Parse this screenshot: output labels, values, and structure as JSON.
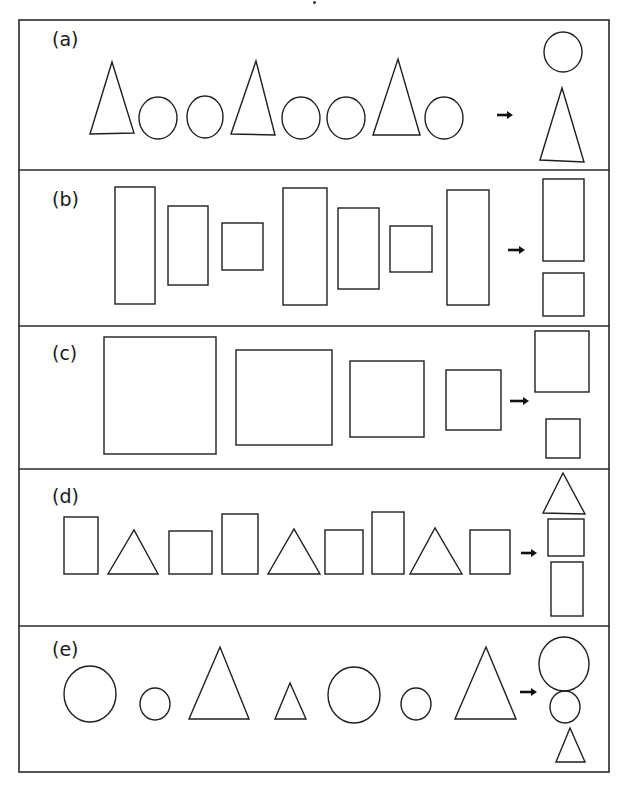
{
  "frame": {
    "x": 19,
    "y": 20,
    "width": 590,
    "height": 752,
    "stroke": "#2a2a2a",
    "stroke_width": 1.6
  },
  "panels": [
    {
      "id": "a",
      "label": "(a)",
      "top": 20,
      "bottom": 170,
      "label_x": 52,
      "label_y": 28,
      "arrow": {
        "x1": 497,
        "x2": 513,
        "y": 115
      },
      "sequence": [
        {
          "type": "triangle",
          "points": "90,134 112,62 134,133"
        },
        {
          "type": "circle",
          "cx": 158,
          "cy": 118,
          "rx": 19,
          "ry": 21
        },
        {
          "type": "circle",
          "cx": 205,
          "cy": 117,
          "rx": 18,
          "ry": 21
        },
        {
          "type": "triangle",
          "points": "231,134 256,61 275,135"
        },
        {
          "type": "circle",
          "cx": 301,
          "cy": 118,
          "rx": 19,
          "ry": 21
        },
        {
          "type": "circle",
          "cx": 346,
          "cy": 118,
          "rx": 19,
          "ry": 21
        },
        {
          "type": "triangle",
          "points": "373,135 398,59 420,135"
        },
        {
          "type": "circle",
          "cx": 444,
          "cy": 118,
          "rx": 19,
          "ry": 21
        }
      ],
      "answer": [
        {
          "type": "circle",
          "cx": 563,
          "cy": 52,
          "rx": 19,
          "ry": 20
        },
        {
          "type": "triangle",
          "points": "540,160 562,88 584,162"
        }
      ]
    },
    {
      "id": "b",
      "label": "(b)",
      "top": 170,
      "bottom": 326,
      "label_x": 52,
      "label_y": 188,
      "arrow": {
        "x1": 508,
        "x2": 525,
        "y": 250
      },
      "sequence": [
        {
          "type": "rect",
          "x": 115,
          "y": 187,
          "w": 40,
          "h": 117
        },
        {
          "type": "rect",
          "x": 168,
          "y": 206,
          "w": 40,
          "h": 79
        },
        {
          "type": "rect",
          "x": 222,
          "y": 223,
          "w": 41,
          "h": 47
        },
        {
          "type": "rect",
          "x": 283,
          "y": 188,
          "w": 44,
          "h": 117
        },
        {
          "type": "rect",
          "x": 338,
          "y": 208,
          "w": 41,
          "h": 81
        },
        {
          "type": "rect",
          "x": 390,
          "y": 226,
          "w": 42,
          "h": 46
        },
        {
          "type": "rect",
          "x": 447,
          "y": 190,
          "w": 42,
          "h": 115
        }
      ],
      "answer": [
        {
          "type": "rect",
          "x": 543,
          "y": 179,
          "w": 41,
          "h": 82
        },
        {
          "type": "rect",
          "x": 543,
          "y": 273,
          "w": 41,
          "h": 43
        }
      ]
    },
    {
      "id": "c",
      "label": "(c)",
      "top": 326,
      "bottom": 469,
      "label_x": 52,
      "label_y": 342,
      "arrow": {
        "x1": 510,
        "x2": 529,
        "y": 401
      },
      "sequence": [
        {
          "type": "rect",
          "x": 104,
          "y": 337,
          "w": 112,
          "h": 117
        },
        {
          "type": "rect",
          "x": 236,
          "y": 350,
          "w": 96,
          "h": 95
        },
        {
          "type": "rect",
          "x": 350,
          "y": 361,
          "w": 74,
          "h": 76
        },
        {
          "type": "rect",
          "x": 446,
          "y": 370,
          "w": 55,
          "h": 60
        }
      ],
      "answer": [
        {
          "type": "rect",
          "x": 535,
          "y": 331,
          "w": 54,
          "h": 61
        },
        {
          "type": "rect",
          "x": 546,
          "y": 419,
          "w": 34,
          "h": 39
        }
      ]
    },
    {
      "id": "d",
      "label": "(d)",
      "top": 469,
      "bottom": 626,
      "label_x": 52,
      "label_y": 485,
      "arrow": {
        "x1": 521,
        "x2": 537,
        "y": 553
      },
      "sequence": [
        {
          "type": "rect",
          "x": 64,
          "y": 517,
          "w": 34,
          "h": 57
        },
        {
          "type": "triangle",
          "points": "108,574 134,530 158,574"
        },
        {
          "type": "rect",
          "x": 169,
          "y": 531,
          "w": 43,
          "h": 43
        },
        {
          "type": "rect",
          "x": 222,
          "y": 514,
          "w": 36,
          "h": 60
        },
        {
          "type": "triangle",
          "points": "268,574 294,529 320,574"
        },
        {
          "type": "rect",
          "x": 325,
          "y": 530,
          "w": 38,
          "h": 44
        },
        {
          "type": "rect",
          "x": 372,
          "y": 512,
          "w": 32,
          "h": 62
        },
        {
          "type": "triangle",
          "points": "410,574 435,528 462,574"
        },
        {
          "type": "rect",
          "x": 470,
          "y": 530,
          "w": 40,
          "h": 44
        }
      ],
      "answer": [
        {
          "type": "triangle",
          "points": "543,513 563,473 585,514"
        },
        {
          "type": "rect",
          "x": 548,
          "y": 519,
          "w": 36,
          "h": 37
        },
        {
          "type": "rect",
          "x": 551,
          "y": 562,
          "w": 32,
          "h": 54
        }
      ]
    },
    {
      "id": "e",
      "label": "(e)",
      "top": 626,
      "bottom": 772,
      "label_x": 52,
      "label_y": 638,
      "arrow": {
        "x1": 520,
        "x2": 537,
        "y": 692
      },
      "sequence": [
        {
          "type": "circle",
          "cx": 90,
          "cy": 694,
          "rx": 26,
          "ry": 28
        },
        {
          "type": "circle",
          "cx": 155,
          "cy": 704,
          "rx": 15,
          "ry": 16
        },
        {
          "type": "triangle",
          "points": "189,719 220,647 249,719"
        },
        {
          "type": "triangle",
          "points": "275,719 290,683 306,719"
        },
        {
          "type": "circle",
          "cx": 354,
          "cy": 695,
          "rx": 26,
          "ry": 28
        },
        {
          "type": "circle",
          "cx": 416,
          "cy": 704,
          "rx": 15,
          "ry": 16
        },
        {
          "type": "triangle",
          "points": "455,719 486,647 516,719"
        }
      ],
      "answer": [
        {
          "type": "circle",
          "cx": 564,
          "cy": 664,
          "rx": 25,
          "ry": 27
        },
        {
          "type": "circle",
          "cx": 565,
          "cy": 707,
          "rx": 15,
          "ry": 16
        },
        {
          "type": "triangle",
          "points": "556,762 570,728 585,762"
        }
      ]
    }
  ],
  "style": {
    "shape_stroke": "#1f1f1f",
    "shape_stroke_width": 1.4,
    "arrow_color": "#111111"
  }
}
